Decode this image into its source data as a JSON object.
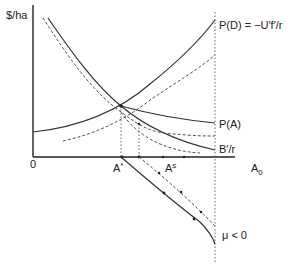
{
  "diagram": {
    "y_axis_label": "$/ha",
    "origin_label": "0",
    "x_axis_end_label": "A",
    "x_axis_end_subscript": "0",
    "curves": [
      {
        "id": "pd",
        "label": "P(D) = −U′f′/r",
        "style": "solid"
      },
      {
        "id": "pa",
        "label": "P(A)",
        "style": "solid"
      },
      {
        "id": "br",
        "label": "B′/r",
        "style": "solid"
      }
    ],
    "points": {
      "a_star": {
        "label": "A",
        "superscript": "*"
      },
      "a_s": {
        "label": "A",
        "superscript": "s"
      }
    },
    "phase_label": "μ < 0"
  },
  "colors": {
    "line": "#333333",
    "dashed": "#555555",
    "dotted": "#666666"
  }
}
